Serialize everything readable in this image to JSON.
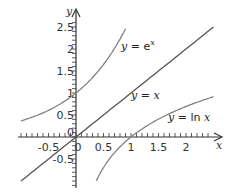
{
  "chart_data": {
    "type": "line",
    "title": "",
    "xlabel": "x",
    "ylabel": "y",
    "xlim": [
      -1,
      2.5
    ],
    "ylim": [
      -1,
      2.7
    ],
    "grid": false,
    "x_ticks": [
      "-0.5",
      "0",
      "0.5",
      "1",
      "1.5",
      "2"
    ],
    "y_ticks": [
      "-0.5",
      "0",
      "0.5",
      "1",
      "1.5",
      "2",
      "2.5"
    ],
    "series": [
      {
        "name": "y = e^x",
        "label_prefix": "y = e",
        "label_sup": "x",
        "color": "#808080",
        "x": [
          -1,
          -0.5,
          0,
          0.25,
          0.5,
          0.75,
          0.9
        ],
        "y": [
          0.37,
          0.61,
          1.0,
          1.28,
          1.65,
          2.12,
          2.46
        ]
      },
      {
        "name": "y = x",
        "label": "y = x",
        "color": "#555555",
        "x": [
          -1,
          0,
          1,
          2,
          2.5
        ],
        "y": [
          -1,
          0,
          1,
          2,
          2.5
        ]
      },
      {
        "name": "y = ln x",
        "label": "y = ln x",
        "color": "#808080",
        "x": [
          0.37,
          0.5,
          1,
          1.5,
          2,
          2.5
        ],
        "y": [
          -0.99,
          -0.69,
          0,
          0.41,
          0.69,
          0.92
        ]
      }
    ],
    "annotations": [
      "y = e^x",
      "y = x",
      "y = ln x"
    ]
  }
}
